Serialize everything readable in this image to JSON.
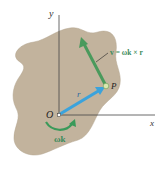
{
  "diagram": {
    "labels": {
      "y_axis": "y",
      "x_axis": "x",
      "origin": "O",
      "point": "P",
      "position_vector": "r",
      "velocity_equation": "v = ωk × r",
      "angular_velocity": "ωk"
    },
    "colors": {
      "body_fill": "#c2b39d",
      "axis": "#333333",
      "position_vector": "#3ba3dc",
      "velocity_vector": "#4a9a5c",
      "rotation_arrow": "#3a9a5a",
      "label_green": "#3a8a5a",
      "text": "#222222"
    }
  }
}
